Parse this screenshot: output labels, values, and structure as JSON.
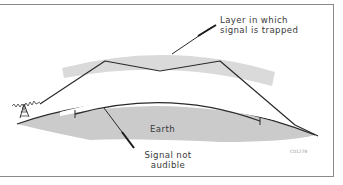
{
  "diagram": {
    "labels": {
      "layer_line1": "Layer in which",
      "layer_line2": "signal is trapped",
      "signal_line1": "Signal not",
      "signal_line2": "audible",
      "earth": "Earth",
      "figure_code": "C01278"
    },
    "colors": {
      "earth_fill": "#c8c8c8",
      "layer_fill": "#dadada",
      "line": "#2a2a2a",
      "frame": "#8a8a8a",
      "text": "#3a3a3a"
    },
    "icons": {
      "transmitter": "radio-tower-icon"
    }
  }
}
